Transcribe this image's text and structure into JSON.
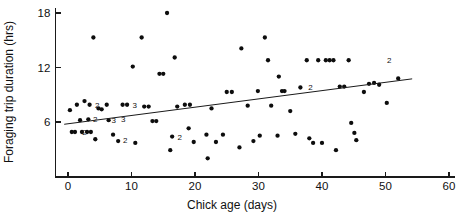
{
  "chart_data": {
    "type": "scatter",
    "title": "",
    "xlabel": "Chick age (days)",
    "ylabel": "Foraging trip duration (hrs)",
    "xlim": [
      -2,
      62
    ],
    "ylim": [
      0.3,
      18.6
    ],
    "xticks": [
      0,
      10,
      20,
      30,
      40,
      50,
      60
    ],
    "xticklabels": [
      "0",
      "10",
      "20",
      "30",
      "40",
      "50",
      "60"
    ],
    "yticks": [
      6,
      12,
      18
    ],
    "yticklabels": [
      "6",
      "12",
      "18"
    ],
    "grid": false,
    "legend": null,
    "marker": "filled-circle",
    "marker_color": "#0d0d0d",
    "axis_color": "#1a1a1a",
    "points": [
      {
        "x": 0.3,
        "y": 7.3
      },
      {
        "x": 0.6,
        "y": 4.9
      },
      {
        "x": 1.1,
        "y": 4.9
      },
      {
        "x": 1.4,
        "y": 7.9
      },
      {
        "x": 1.9,
        "y": 6.2
      },
      {
        "x": 2.2,
        "y": 4.9,
        "n": 2
      },
      {
        "x": 2.6,
        "y": 8.3
      },
      {
        "x": 3.0,
        "y": 4.9
      },
      {
        "x": 3.2,
        "y": 6.3,
        "n": 2
      },
      {
        "x": 3.4,
        "y": 7.9
      },
      {
        "x": 3.6,
        "y": 4.9
      },
      {
        "x": 4.0,
        "y": 15.3
      },
      {
        "x": 4.3,
        "y": 4.1
      },
      {
        "x": 4.8,
        "y": 7.5
      },
      {
        "x": 5.3,
        "y": 7.4,
        "n": 2
      },
      {
        "x": 6.1,
        "y": 7.9
      },
      {
        "x": 6.4,
        "y": 6.2,
        "n": 3
      },
      {
        "x": 7.1,
        "y": 4.6
      },
      {
        "x": 7.9,
        "y": 3.9,
        "n": 2
      },
      {
        "x": 8.6,
        "y": 7.9
      },
      {
        "x": 9.3,
        "y": 7.9,
        "n": 3
      },
      {
        "x": 10.2,
        "y": 12.1
      },
      {
        "x": 10.6,
        "y": 3.7
      },
      {
        "x": 11.6,
        "y": 15.3
      },
      {
        "x": 12.0,
        "y": 7.7
      },
      {
        "x": 12.7,
        "y": 7.7
      },
      {
        "x": 13.3,
        "y": 6.1
      },
      {
        "x": 13.9,
        "y": 6.1
      },
      {
        "x": 14.4,
        "y": 11.3
      },
      {
        "x": 15.0,
        "y": 11.3
      },
      {
        "x": 15.6,
        "y": 18.0
      },
      {
        "x": 16.1,
        "y": 2.9
      },
      {
        "x": 16.4,
        "y": 4.4,
        "n": 2
      },
      {
        "x": 16.8,
        "y": 13.1
      },
      {
        "x": 17.2,
        "y": 7.7
      },
      {
        "x": 18.4,
        "y": 7.9
      },
      {
        "x": 19.2,
        "y": 7.9
      },
      {
        "x": 19.8,
        "y": 3.8
      },
      {
        "x": 22.0,
        "y": 2.0
      },
      {
        "x": 22.6,
        "y": 7.5
      },
      {
        "x": 23.3,
        "y": 3.8
      },
      {
        "x": 25.0,
        "y": 9.3
      },
      {
        "x": 25.8,
        "y": 9.3
      },
      {
        "x": 27.3,
        "y": 14.1
      },
      {
        "x": 28.3,
        "y": 7.8
      },
      {
        "x": 29.2,
        "y": 3.9
      },
      {
        "x": 29.9,
        "y": 9.4
      },
      {
        "x": 31.0,
        "y": 15.3
      },
      {
        "x": 31.5,
        "y": 12.8
      },
      {
        "x": 32.0,
        "y": 7.8
      },
      {
        "x": 33.2,
        "y": 11.0
      },
      {
        "x": 33.7,
        "y": 9.4
      },
      {
        "x": 34.1,
        "y": 9.4
      },
      {
        "x": 35.0,
        "y": 7.2
      },
      {
        "x": 35.8,
        "y": 4.7
      },
      {
        "x": 36.6,
        "y": 9.8,
        "n": 2
      },
      {
        "x": 37.6,
        "y": 12.8
      },
      {
        "x": 38.0,
        "y": 4.2
      },
      {
        "x": 38.6,
        "y": 3.7
      },
      {
        "x": 39.4,
        "y": 12.8
      },
      {
        "x": 40.0,
        "y": 3.7
      },
      {
        "x": 40.6,
        "y": 12.8
      },
      {
        "x": 41.2,
        "y": 12.8
      },
      {
        "x": 41.8,
        "y": 12.8
      },
      {
        "x": 42.2,
        "y": 2.9
      },
      {
        "x": 42.8,
        "y": 9.9
      },
      {
        "x": 43.5,
        "y": 9.9
      },
      {
        "x": 44.2,
        "y": 12.8
      },
      {
        "x": 44.6,
        "y": 5.9
      },
      {
        "x": 45.1,
        "y": 4.8
      },
      {
        "x": 45.4,
        "y": 4.0
      },
      {
        "x": 46.6,
        "y": 9.3
      },
      {
        "x": 47.4,
        "y": 10.2
      },
      {
        "x": 48.2,
        "y": 10.3
      },
      {
        "x": 49.0,
        "y": 10.1
      },
      {
        "x": 50.2,
        "y": 8.1
      },
      {
        "x": 52.0,
        "y": 10.8
      },
      {
        "x": 19.0,
        "y": 5.3
      },
      {
        "x": 21.8,
        "y": 4.6
      },
      {
        "x": 24.4,
        "y": 4.6
      },
      {
        "x": 27.0,
        "y": 3.2
      },
      {
        "x": 30.2,
        "y": 4.5
      },
      {
        "x": 33.0,
        "y": 4.5
      }
    ],
    "overlap_labels": [
      {
        "x": 2.6,
        "y": 4.9,
        "text": "2"
      },
      {
        "x": 4.6,
        "y": 7.9,
        "text": "2"
      },
      {
        "x": 4.3,
        "y": 6.3,
        "text": "2"
      },
      {
        "x": 7.2,
        "y": 6.2,
        "text": "3"
      },
      {
        "x": 8.7,
        "y": 6.3,
        "text": "3"
      },
      {
        "x": 9.0,
        "y": 4.0,
        "text": "2"
      },
      {
        "x": 10.5,
        "y": 7.9,
        "text": "3"
      },
      {
        "x": 17.6,
        "y": 4.4,
        "text": "2"
      },
      {
        "x": 38.2,
        "y": 9.9,
        "text": "2"
      },
      {
        "x": 50.6,
        "y": 12.8,
        "text": "2"
      }
    ],
    "fit_line": {
      "x1": -0.6,
      "y1": 5.75,
      "x2": 54.2,
      "y2": 10.75,
      "type": "linear-regression"
    }
  }
}
